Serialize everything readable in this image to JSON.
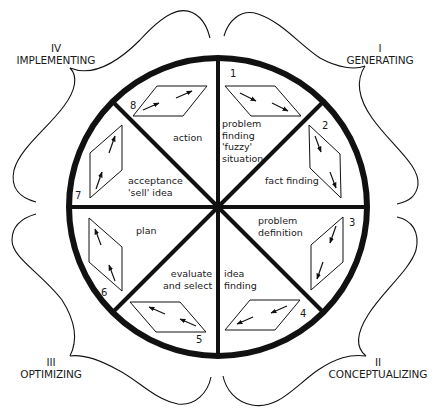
{
  "diagram": {
    "type": "creative-problem-solving-wheel",
    "colors": {
      "ink": "#111111",
      "background": "#ffffff"
    },
    "quadrants": [
      {
        "numeral": "I",
        "name": "GENERATING",
        "position": "top-right"
      },
      {
        "numeral": "II",
        "name": "CONCEPTUALIZING",
        "position": "bottom-right"
      },
      {
        "numeral": "III",
        "name": "OPTIMIZING",
        "position": "bottom-left"
      },
      {
        "numeral": "IV",
        "name": "IMPLEMENTING",
        "position": "top-left"
      }
    ],
    "segments": [
      {
        "number": "1",
        "lines": [
          "problem",
          "finding",
          "'fuzzy'",
          "situation"
        ]
      },
      {
        "number": "2",
        "lines": [
          "fact finding"
        ]
      },
      {
        "number": "3",
        "lines": [
          "problem",
          "definition"
        ]
      },
      {
        "number": "4",
        "lines": [
          "idea",
          "finding"
        ]
      },
      {
        "number": "5",
        "lines": [
          "evaluate",
          "and select"
        ]
      },
      {
        "number": "6",
        "lines": [
          "plan"
        ]
      },
      {
        "number": "7",
        "lines": [
          "acceptance",
          "'sell' idea"
        ]
      },
      {
        "number": "8",
        "lines": [
          "action"
        ]
      }
    ]
  }
}
